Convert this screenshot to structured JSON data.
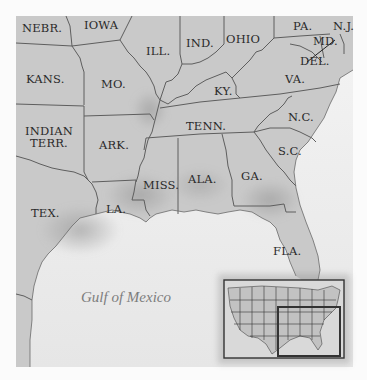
{
  "map": {
    "colors": {
      "background": "#fbfbfb",
      "land": "#c9c9c9",
      "land_dark": "#a9a9a9",
      "water": "#ececec",
      "border": "#5e5e5e",
      "label": "#2a2a2a",
      "water_label": "#7d7d7d"
    },
    "states": [
      {
        "id": "nebr",
        "label": "NEBR.",
        "x": 22,
        "y": 22
      },
      {
        "id": "iowa",
        "label": "IOWA",
        "x": 84,
        "y": 19
      },
      {
        "id": "ill",
        "label": "ILL.",
        "x": 146,
        "y": 45
      },
      {
        "id": "ind",
        "label": "IND.",
        "x": 186,
        "y": 37
      },
      {
        "id": "ohio",
        "label": "OHIO",
        "x": 226,
        "y": 33
      },
      {
        "id": "pa",
        "label": "PA.",
        "x": 293,
        "y": 20
      },
      {
        "id": "nj",
        "label": "N.J.",
        "x": 333,
        "y": 20
      },
      {
        "id": "md",
        "label": "MD.",
        "x": 313,
        "y": 35
      },
      {
        "id": "del",
        "label": "DEL.",
        "x": 300,
        "y": 55
      },
      {
        "id": "kans",
        "label": "KANS.",
        "x": 26,
        "y": 73
      },
      {
        "id": "mo",
        "label": "MO.",
        "x": 101,
        "y": 78
      },
      {
        "id": "ky",
        "label": "KY.",
        "x": 214,
        "y": 85
      },
      {
        "id": "va",
        "label": "VA.",
        "x": 285,
        "y": 73
      },
      {
        "id": "indian_terr",
        "label": "INDIAN\nTERR.",
        "x": 25,
        "y": 125
      },
      {
        "id": "ark",
        "label": "ARK.",
        "x": 99,
        "y": 139
      },
      {
        "id": "tenn",
        "label": "TENN.",
        "x": 186,
        "y": 120
      },
      {
        "id": "nc",
        "label": "N.C.",
        "x": 288,
        "y": 111
      },
      {
        "id": "sc",
        "label": "S.C.",
        "x": 278,
        "y": 145
      },
      {
        "id": "miss",
        "label": "MISS.",
        "x": 143,
        "y": 179
      },
      {
        "id": "ala",
        "label": "ALA.",
        "x": 188,
        "y": 173
      },
      {
        "id": "ga",
        "label": "GA.",
        "x": 241,
        "y": 170
      },
      {
        "id": "tex",
        "label": "TEX.",
        "x": 31,
        "y": 207
      },
      {
        "id": "la",
        "label": "LA.",
        "x": 106,
        "y": 203
      },
      {
        "id": "fla",
        "label": "FLA.",
        "x": 273,
        "y": 245
      }
    ],
    "water_bodies": [
      {
        "id": "gulf",
        "label": "Gulf of Mexico",
        "x": 81,
        "y": 289
      }
    ],
    "inset": {
      "label": "United States locator map",
      "x": 224,
      "y": 280,
      "width": 120,
      "height": 78,
      "highlight": {
        "x": 278,
        "y": 307,
        "width": 62,
        "height": 49
      }
    }
  }
}
